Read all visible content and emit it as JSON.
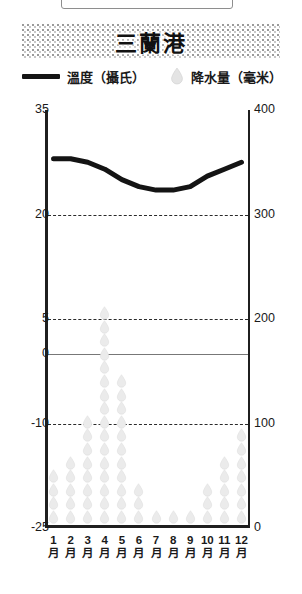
{
  "title": "三蘭港",
  "legend": {
    "temperature": {
      "label": "溫度（攝氏）",
      "icon": "line-swatch-icon",
      "color": "#141414"
    },
    "precipitation": {
      "label": "降水量（毫米）",
      "icon": "raindrop-icon",
      "color": "#e2e2e2"
    }
  },
  "axes": {
    "left": {
      "unit": "°C",
      "ticks": [
        "35",
        "20",
        "5",
        "0",
        "-10",
        "-25"
      ],
      "min": -25,
      "max": 35
    },
    "right": {
      "unit": "mm",
      "ticks": [
        "400",
        "300",
        "200",
        "100",
        "0"
      ],
      "min": 0,
      "max": 400
    },
    "x": {
      "months": [
        "1",
        "2",
        "3",
        "4",
        "5",
        "6",
        "7",
        "8",
        "9",
        "10",
        "11",
        "12"
      ],
      "month_suffix": "月"
    }
  },
  "chart_data": {
    "type": "line",
    "title": "三蘭港",
    "xlabel": "",
    "ylabel": "溫度（攝氏）",
    "categories": [
      "1月",
      "2月",
      "3月",
      "4月",
      "5月",
      "6月",
      "7月",
      "8月",
      "9月",
      "10月",
      "11月",
      "12月"
    ],
    "grid": true,
    "legend_position": "top",
    "series": [
      {
        "name": "溫度（攝氏）",
        "type": "line",
        "unit": "°C",
        "axis": "left",
        "color": "#141414",
        "values": [
          28,
          28,
          27.5,
          26.5,
          25,
          24,
          23.5,
          23.5,
          24,
          25.5,
          26.5,
          27.5
        ],
        "ylim": [
          -25,
          35
        ]
      },
      {
        "name": "降水量（毫米）",
        "type": "pictogram",
        "unit": "mm",
        "axis": "right",
        "color": "#e2e2e2",
        "drop_counts": [
          4,
          5,
          8,
          16,
          11,
          3,
          1,
          1,
          1,
          3,
          5,
          7
        ],
        "values": [
          65,
          70,
          130,
          290,
          190,
          35,
          30,
          25,
          30,
          45,
          110,
          120
        ],
        "ylim": [
          0,
          400
        ]
      }
    ]
  }
}
